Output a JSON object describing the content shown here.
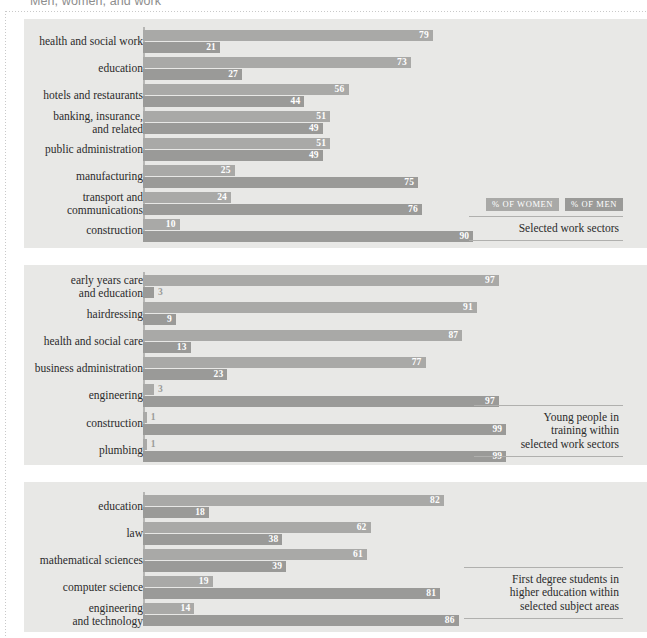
{
  "page": {
    "title": "Men, women, and work"
  },
  "legend": {
    "women_label": "% OF WOMEN",
    "men_label": "% OF MEN",
    "women_color": "#a9a9a7",
    "men_color": "#9a9a98"
  },
  "chart_data": [
    {
      "type": "bar",
      "orientation": "horizontal",
      "title": "Selected work sectors",
      "caption": "Selected work sectors",
      "xlabel": "",
      "ylabel": "",
      "xlim": [
        0,
        100
      ],
      "grid": false,
      "legend_position": "bottom-right",
      "categories": [
        "health and social work",
        "education",
        "hotels and restaurants",
        "banking, insurance,\nand related",
        "public administration",
        "manufacturing",
        "transport and\ncommunications",
        "construction"
      ],
      "series": [
        {
          "name": "% OF WOMEN",
          "values": [
            79,
            73,
            56,
            51,
            51,
            25,
            24,
            10
          ]
        },
        {
          "name": "% OF MEN",
          "values": [
            21,
            27,
            44,
            49,
            49,
            75,
            76,
            90
          ]
        }
      ]
    },
    {
      "type": "bar",
      "orientation": "horizontal",
      "title": "Young people in training within selected work sectors",
      "caption": "Young people in\ntraining within\nselected work sectors",
      "xlabel": "",
      "ylabel": "",
      "xlim": [
        0,
        100
      ],
      "grid": false,
      "legend_position": "none",
      "categories": [
        "early years care\nand education",
        "hairdressing",
        "health and social care",
        "business administration",
        "engineering",
        "construction",
        "plumbing"
      ],
      "series": [
        {
          "name": "% OF WOMEN",
          "values": [
            97,
            91,
            87,
            77,
            3,
            1,
            1
          ]
        },
        {
          "name": "% OF MEN",
          "values": [
            3,
            9,
            13,
            23,
            97,
            99,
            99
          ]
        }
      ]
    },
    {
      "type": "bar",
      "orientation": "horizontal",
      "title": "First degree students in higher education within selected subject areas",
      "caption": "First degree students in\nhigher education within\nselected subject areas",
      "xlabel": "",
      "ylabel": "",
      "xlim": [
        0,
        100
      ],
      "grid": false,
      "legend_position": "none",
      "categories": [
        "education",
        "law",
        "mathematical sciences",
        "computer science",
        "engineering\nand technology"
      ],
      "series": [
        {
          "name": "% OF WOMEN",
          "values": [
            82,
            62,
            61,
            19,
            14
          ]
        },
        {
          "name": "% OF MEN",
          "values": [
            18,
            38,
            39,
            81,
            86
          ]
        }
      ]
    }
  ]
}
